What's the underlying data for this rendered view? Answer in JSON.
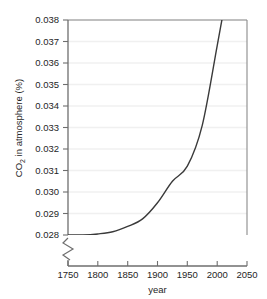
{
  "chart_data": {
    "type": "line",
    "title": "",
    "subtitle": "",
    "xlabel": "year",
    "ylabel": "CO2 in atmosphere (%)",
    "ylabel_parts": {
      "prefix": "CO",
      "subscript": "2",
      "suffix": " in atmosphere (%)"
    },
    "xlim": [
      1750,
      2050
    ],
    "ylim": [
      0.028,
      0.038
    ],
    "xticks": [
      1750,
      1800,
      1850,
      1900,
      1950,
      2000,
      2050
    ],
    "xtick_labels": [
      "1750",
      "1800",
      "1850",
      "1900",
      "1950",
      "2000",
      "2050"
    ],
    "yticks": [
      0.028,
      0.029,
      0.03,
      0.031,
      0.032,
      0.033,
      0.034,
      0.035,
      0.036,
      0.037,
      0.038
    ],
    "ytick_labels": [
      "0.028",
      "0.029",
      "0.030",
      "0.031",
      "0.032",
      "0.033",
      "0.034",
      "0.035",
      "0.036",
      "0.037",
      "0.038"
    ],
    "grid": true,
    "grid_axis": "y",
    "legend": false,
    "legend_position": "none",
    "axis_break": {
      "present": true,
      "axis": "y",
      "below_value": 0.028,
      "symbol": "zigzag"
    },
    "series": [
      {
        "name": "CO2 concentration",
        "color": "#3a3a3a",
        "linewidth": 1.4,
        "x": [
          1750,
          1775,
          1800,
          1825,
          1850,
          1875,
          1900,
          1925,
          1950,
          1975,
          2000,
          2010,
          2020,
          2025
        ],
        "values": [
          0.028,
          0.028,
          0.02805,
          0.02815,
          0.0284,
          0.02875,
          0.0295,
          0.0305,
          0.0312,
          0.0331,
          0.0368,
          0.0383,
          0.0396,
          0.0403
        ]
      }
    ],
    "colors": {
      "line": "#3a3a3a",
      "axis": "#6e6e6e",
      "grid": "#f0f0f0",
      "text": "#262626",
      "background": "#ffffff"
    }
  }
}
